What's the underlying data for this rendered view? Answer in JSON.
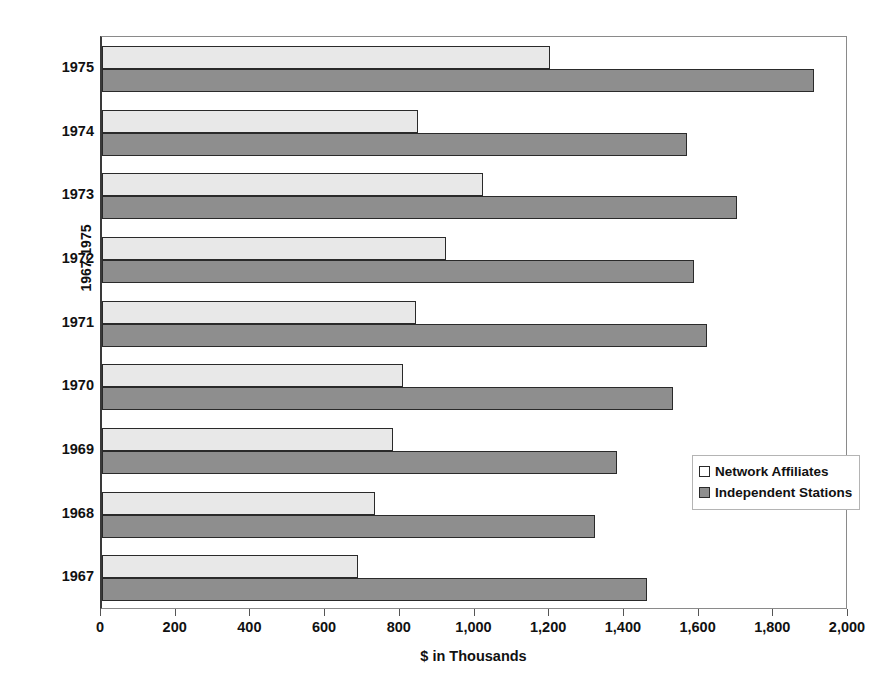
{
  "chart_data": {
    "type": "bar",
    "orientation": "horizontal",
    "title": "",
    "xlabel": "$ in Thousands",
    "ylabel": "1967-1975",
    "xlim": [
      0,
      2000
    ],
    "xticks": [
      0,
      200,
      400,
      600,
      800,
      1000,
      1200,
      1400,
      1600,
      1800,
      2000
    ],
    "xtick_labels": [
      "0",
      "200",
      "400",
      "600",
      "800",
      "1,000",
      "1,200",
      "1,400",
      "1,600",
      "1,800",
      "2,000"
    ],
    "categories": [
      "1975",
      "1974",
      "1973",
      "1972",
      "1971",
      "1970",
      "1969",
      "1968",
      "1967"
    ],
    "grid": false,
    "legend_position": "inside-right",
    "series": [
      {
        "name": "Network Affiliates",
        "color": "#e8e8e8",
        "values": [
          1200,
          845,
          1020,
          920,
          840,
          805,
          780,
          730,
          685
        ]
      },
      {
        "name": "Independent Stations",
        "color": "#8e8e8e",
        "values": [
          1905,
          1565,
          1700,
          1585,
          1620,
          1530,
          1380,
          1320,
          1460
        ]
      }
    ]
  },
  "legend": {
    "items": [
      {
        "label": "Network Affiliates"
      },
      {
        "label": "Independent Stations"
      }
    ]
  }
}
